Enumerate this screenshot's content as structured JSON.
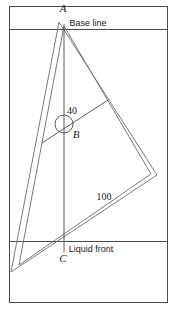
{
  "figure": {
    "frame": {
      "x": 9,
      "y": 6,
      "width": 159,
      "height": 297,
      "stroke": "#4a4a4a"
    },
    "guides": [
      {
        "name": "base-line",
        "label": "Base line",
        "y": 29,
        "label_x": 88,
        "label_y": 23
      },
      {
        "name": "liquid-front-line",
        "label": "Liquid front",
        "y": 241,
        "label_x": 88,
        "label_y": 250
      }
    ],
    "vertices": {
      "A": {
        "label": "A",
        "x": 63,
        "y": 10,
        "point_x": 64,
        "point_y": 24
      },
      "B": {
        "label": "B",
        "x": 76,
        "y": 134,
        "point_x": 64,
        "point_y": 124
      },
      "C": {
        "label": "C",
        "x": 62,
        "y": 258,
        "point_x": 64,
        "point_y": 243
      }
    },
    "measurements": [
      {
        "name": "angle-40",
        "label": "40",
        "x": 72,
        "y": 110
      },
      {
        "name": "distance-100",
        "label": "100",
        "x": 104,
        "y": 196
      }
    ],
    "shapes": {
      "outer_triangle": "59,22 157,175 11,272",
      "inner_triangle": "64,26 151,174 19,265",
      "vertical_axis": {
        "x1": 64,
        "y1": 24,
        "x2": 64,
        "y2": 252
      },
      "angle_ray": {
        "x1": 42,
        "y1": 143,
        "x2": 108,
        "y2": 100
      },
      "angle_circle": {
        "cx": 64,
        "cy": 124,
        "r": 9
      }
    },
    "colors": {
      "frame_stroke": "#4a4a4a",
      "shape_stroke": "#6a6a6a",
      "text": "#1a1a1a",
      "background": "#ffffff"
    }
  }
}
